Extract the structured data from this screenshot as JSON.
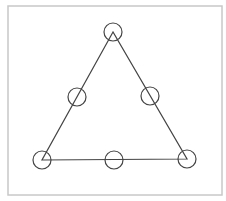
{
  "diagram": {
    "frame": {
      "x": 8,
      "y": 6,
      "width": 214,
      "height": 189,
      "stroke": "#c8c8c8"
    },
    "triangle": {
      "vertices": [
        [
          113,
          32
        ],
        [
          42,
          160
        ],
        [
          187,
          159
        ]
      ],
      "stroke": "#444444"
    },
    "nodes": [
      {
        "id": "top",
        "cx": 113,
        "cy": 32,
        "r": 9
      },
      {
        "id": "left-mid",
        "cx": 77,
        "cy": 97,
        "r": 9
      },
      {
        "id": "right-mid",
        "cx": 150,
        "cy": 96,
        "r": 9
      },
      {
        "id": "bottom-left",
        "cx": 42,
        "cy": 160,
        "r": 9
      },
      {
        "id": "bottom-mid",
        "cx": 114,
        "cy": 160,
        "r": 9
      },
      {
        "id": "bottom-right",
        "cx": 187,
        "cy": 159,
        "r": 9
      }
    ],
    "node_stroke": "#444444"
  }
}
